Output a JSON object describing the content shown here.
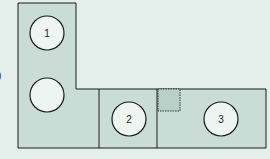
{
  "diagram": {
    "colors": {
      "fill": "#c9ddd6",
      "background": "#e4eeea",
      "stroke": "#1a1a1a",
      "circle_fill": "#eef4f1"
    },
    "circles": [
      {
        "label": "1"
      },
      {
        "label": ""
      },
      {
        "label": "2"
      },
      {
        "label": "3"
      }
    ],
    "edge_mark": ")"
  }
}
